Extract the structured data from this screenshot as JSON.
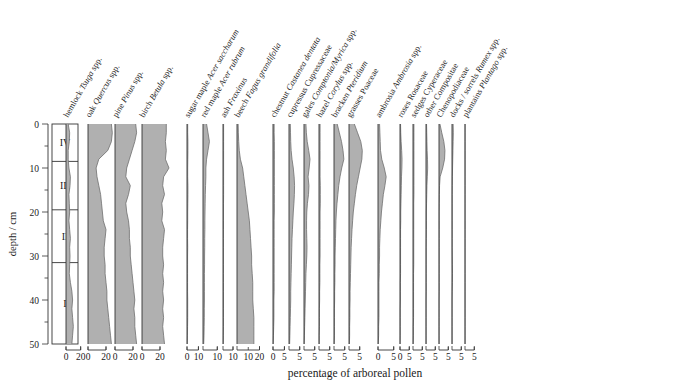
{
  "figure": {
    "kind": "pollen-stratigraphic-diagram",
    "caption": "percentage of arboreal pollen",
    "depth_axis_label": "depth / cm",
    "colors": {
      "fill": "#b0b0b0",
      "stroke": "#6e6e6e",
      "axis": "#333333",
      "text": "#1a1a1a",
      "background": "#ffffff"
    }
  },
  "depth_axis": {
    "label": "depth / cm",
    "min": 0,
    "max": 50,
    "major_ticks": [
      0,
      10,
      20,
      30,
      40,
      50
    ],
    "major_tick_labels": [
      "0",
      "10",
      "20",
      "30",
      "40",
      "50"
    ],
    "minor_tick_step": 5
  },
  "zones": [
    {
      "name": "IV",
      "top": 0,
      "bottom": 8.5
    },
    {
      "name": "III",
      "top": 8.5,
      "bottom": 19.5
    },
    {
      "name": "II",
      "top": 19.5,
      "bottom": 31.5
    },
    {
      "name": "I",
      "top": 31.5,
      "bottom": 50
    }
  ],
  "chart_data": {
    "type": "area",
    "title": "",
    "xlabel": "percentage of arboreal pollen",
    "ylabel": "depth / cm",
    "ylim": [
      0,
      50
    ],
    "grid": false,
    "legend": "none",
    "orientation": "vertical-depth-down",
    "depths": [
      0,
      2,
      4,
      6,
      8,
      10,
      12,
      14,
      16,
      18,
      20,
      22,
      24,
      26,
      28,
      30,
      32,
      34,
      36,
      38,
      40,
      42,
      44,
      46,
      48,
      50
    ],
    "taxa": [
      {
        "common": "hemlock",
        "latin": "Tsuga spp.",
        "latin_italic": "Tsuga",
        "latin_plain": " spp.",
        "xmax": 30,
        "ticks": [
          0,
          20
        ],
        "tick_labels": [
          "0",
          "20"
        ],
        "values": [
          3,
          5,
          4.5,
          3,
          3,
          4,
          6,
          5.5,
          4,
          4.5,
          5,
          4,
          5,
          6,
          5,
          5.5,
          5,
          4.5,
          6,
          8,
          9,
          8,
          9,
          10,
          9,
          8
        ]
      },
      {
        "common": "oak",
        "latin": "Quercus spp.",
        "latin_italic": "Quercus",
        "latin_plain": " spp.",
        "xmax": 30,
        "ticks": [
          0,
          20
        ],
        "tick_labels": [
          "0",
          "20"
        ],
        "values": [
          26,
          27,
          26,
          22,
          12,
          9,
          10,
          12,
          14,
          15,
          16,
          17,
          20,
          19,
          18,
          18,
          19,
          19,
          20,
          21,
          21,
          22,
          23,
          24,
          25,
          26
        ]
      },
      {
        "common": "pine",
        "latin": "Pinus spp.",
        "latin_italic": "Pinus",
        "latin_plain": " spp.",
        "xmax": 30,
        "ticks": [
          0,
          20
        ],
        "tick_labels": [
          "0",
          "20"
        ],
        "values": [
          23,
          24,
          22,
          19,
          16,
          13,
          12,
          17,
          15,
          12,
          13,
          15,
          16,
          16,
          17,
          17,
          18,
          19,
          20,
          21,
          22,
          21,
          22,
          22,
          23,
          24
        ]
      },
      {
        "common": "birch",
        "latin": "Betula spp.",
        "latin_italic": "Betula",
        "latin_plain": " spp.",
        "xmax": 30,
        "ticks": [
          0,
          20
        ],
        "tick_labels": [
          "0",
          "20"
        ],
        "values": [
          27,
          27,
          26,
          27,
          26,
          30,
          24,
          23,
          25,
          22,
          23,
          22,
          25,
          24,
          23,
          23,
          24,
          23,
          24,
          23,
          24,
          23,
          24,
          23,
          24,
          25
        ]
      },
      {
        "common": "sugar maple",
        "latin": "Acer saccharum",
        "latin_italic": "Acer saccharum",
        "latin_plain": "",
        "xmax": 14,
        "ticks": [
          0,
          10
        ],
        "tick_labels": [
          "0",
          "10"
        ],
        "values": [
          0.6,
          0.6,
          0.8,
          0.8,
          0.7,
          0.6,
          0.6,
          0.8,
          0.8,
          0.7,
          0.6,
          0.6,
          0.5,
          0.5,
          0.6,
          0.5,
          0.5,
          0.5,
          0.5,
          0.5,
          0.6,
          0.6,
          0.6,
          0.5,
          0.4,
          0.3
        ]
      },
      {
        "common": "red maple",
        "latin": "Acer rubrum",
        "latin_italic": "Acer rubrum",
        "latin_plain": "",
        "xmax": 14,
        "ticks": [
          10
        ],
        "tick_labels": [
          "10"
        ],
        "values": [
          2.5,
          3.5,
          4.5,
          3.5,
          2.5,
          2,
          2,
          1.8,
          1.6,
          1.5,
          1.4,
          1.3,
          1.3,
          1.2,
          1.2,
          1.1,
          1.1,
          1,
          1,
          1,
          1,
          0.9,
          0.9,
          0.8,
          0.7,
          0.5
        ]
      },
      {
        "common": "ash",
        "latin": "Fraxinus",
        "latin_italic": "Fraxinus",
        "latin_plain": "",
        "xmax": 14,
        "ticks": [
          10
        ],
        "tick_labels": [
          "10"
        ],
        "values": [
          0.6,
          0.6,
          0.6,
          0.6,
          0.6,
          0.6,
          0.6,
          0.6,
          0.6,
          0.5,
          0.5,
          0.5,
          0.5,
          0.5,
          0.5,
          0.5,
          0.5,
          0.5,
          0.5,
          0.5,
          0.5,
          0.5,
          0.5,
          0.5,
          0.4,
          0.3
        ]
      },
      {
        "common": "beech",
        "latin": "Fagus grandifolia",
        "latin_italic": "Fagus grandifolia",
        "latin_plain": "",
        "xmax": 24,
        "ticks": [
          10,
          20
        ],
        "tick_labels": [
          "10",
          "20"
        ],
        "values": [
          1,
          1.2,
          1.5,
          2,
          3,
          5,
          6,
          7,
          8,
          9,
          10,
          11,
          11.5,
          12,
          12.5,
          13,
          13,
          13.5,
          14,
          14,
          14,
          14.5,
          15,
          15,
          15,
          15
        ]
      },
      {
        "common": "chestnut",
        "latin": "Castanea dentata",
        "latin_italic": "Castanea dentata",
        "latin_plain": "",
        "xmax": 7,
        "ticks": [
          0,
          5
        ],
        "tick_labels": [
          "0",
          "5"
        ],
        "values": [
          0.5,
          0.5,
          0.6,
          0.6,
          0.6,
          0.6,
          0.6,
          0.6,
          0.6,
          0.6,
          0.6,
          0.5,
          0.5,
          0.5,
          0.5,
          0.5,
          0.5,
          0.5,
          0.5,
          0.5,
          0.4,
          0.4,
          0.4,
          0.3,
          0.2,
          0.1
        ]
      },
      {
        "common": "cupressus",
        "latin": "Cupressaceae",
        "latin_italic": "",
        "latin_plain": "Cupressaceae",
        "xmax": 7,
        "ticks": [
          5
        ],
        "tick_labels": [
          "5"
        ],
        "values": [
          0.6,
          0.7,
          0.8,
          1,
          1.4,
          2,
          2.4,
          2.6,
          2.5,
          2.3,
          2,
          1.8,
          1.6,
          1.4,
          1.3,
          1.2,
          1.1,
          1,
          0.9,
          0.8,
          0.8,
          0.7,
          0.6,
          0.5,
          0.4,
          0.3
        ]
      },
      {
        "common": "gales",
        "latin": "Comptonia/Myrica spp.",
        "latin_italic": "Comptonia/Myrica",
        "latin_plain": " spp.",
        "xmax": 7,
        "ticks": [
          5
        ],
        "tick_labels": [
          "5"
        ],
        "values": [
          0.9,
          1.1,
          1.5,
          2.2,
          2.8,
          2.4,
          1.9,
          2.3,
          2.1,
          1.6,
          1.3,
          1.2,
          1.2,
          1.3,
          1.4,
          1.3,
          1.1,
          0.9,
          0.8,
          0.7,
          0.6,
          0.5,
          0.4,
          0.3,
          0.2,
          0.1
        ]
      },
      {
        "common": "hazel",
        "latin": "Corylus spp.",
        "latin_italic": "Corylus",
        "latin_plain": " spp.",
        "xmax": 7,
        "ticks": [
          5
        ],
        "tick_labels": [
          "5"
        ],
        "values": [
          0.5,
          0.5,
          0.5,
          0.5,
          0.5,
          0.5,
          0.5,
          0.6,
          0.6,
          0.6,
          0.5,
          0.5,
          0.5,
          0.5,
          0.5,
          0.5,
          0.4,
          0.4,
          0.4,
          0.3,
          0.3,
          0.2,
          0.2,
          0.2,
          0.1,
          0.1
        ]
      },
      {
        "common": "bracken",
        "latin": "Pteridium",
        "latin_italic": "Pteridium",
        "latin_plain": "",
        "xmax": 7,
        "ticks": [
          5
        ],
        "tick_labels": [
          "5"
        ],
        "values": [
          1.5,
          2.5,
          3.5,
          4.2,
          4.6,
          3.6,
          2.8,
          2.2,
          1.8,
          1.4,
          1.1,
          0.9,
          0.8,
          0.7,
          0.6,
          0.5,
          0.5,
          0.4,
          0.4,
          0.3,
          0.3,
          0.2,
          0.2,
          0.2,
          0.2,
          0.1
        ]
      },
      {
        "common": "grasses",
        "latin": "Poaceae",
        "latin_italic": "",
        "latin_plain": "Poaceae",
        "xmax": 7,
        "ticks": [
          5
        ],
        "tick_labels": [
          "5"
        ],
        "values": [
          2.5,
          4,
          5.5,
          6.2,
          6,
          5.2,
          4.4,
          3.6,
          3,
          2.5,
          2,
          1.7,
          1.4,
          1.2,
          1,
          0.9,
          0.8,
          0.7,
          0.6,
          0.5,
          0.5,
          0.4,
          0.4,
          0.3,
          0.3,
          0.2
        ]
      },
      {
        "common": "ambrosia",
        "latin": "Ambrosia spp.",
        "latin_italic": "Ambrosia",
        "latin_plain": " spp.",
        "xmax": 7,
        "ticks": [
          0,
          5
        ],
        "tick_labels": [
          "0",
          "5"
        ],
        "values": [
          0.5,
          0.6,
          0.7,
          0.8,
          1.2,
          2.0,
          2.6,
          2.2,
          1.7,
          1.4,
          1.1,
          0.9,
          0.7,
          0.6,
          0.5,
          0.5,
          0.4,
          0.4,
          0.3,
          0.3,
          0.3,
          0.3,
          0.3,
          0.2,
          0.2,
          0.1
        ]
      },
      {
        "common": "roses",
        "latin": "Rosaceae",
        "latin_italic": "",
        "latin_plain": "Rosaceae",
        "xmax": 7,
        "ticks": [
          0,
          5
        ],
        "tick_labels": [
          "0",
          "5"
        ],
        "values": [
          0.3,
          0.4,
          0.6,
          0.9,
          1.1,
          1.0,
          0.8,
          0.7,
          0.6,
          0.5,
          0.4,
          0.4,
          0.3,
          0.3,
          0.3,
          0.3,
          0.3,
          0.3,
          0.2,
          0.2,
          0.2,
          0.1,
          0.1,
          0.1,
          0.1,
          0.05
        ]
      },
      {
        "common": "sedges",
        "latin": "Cyperaceae",
        "latin_italic": "",
        "latin_plain": "Cyperaceae",
        "xmax": 7,
        "ticks": [
          5
        ],
        "tick_labels": [
          "5"
        ],
        "values": [
          0.5,
          0.5,
          0.5,
          0.5,
          0.5,
          0.5,
          0.5,
          0.5,
          0.5,
          0.4,
          0.4,
          0.4,
          0.4,
          0.4,
          0.4,
          0.4,
          0.4,
          0.3,
          0.3,
          0.3,
          0.3,
          0.3,
          0.3,
          0.2,
          0.2,
          0.1
        ]
      },
      {
        "common": "other",
        "latin": "Compositae",
        "latin_italic": "",
        "latin_plain": "Compositae",
        "xmax": 7,
        "ticks": [
          5
        ],
        "tick_labels": [
          "5"
        ],
        "values": [
          0.3,
          0.4,
          0.5,
          0.6,
          0.8,
          0.9,
          0.7,
          0.5,
          0.4,
          0.3,
          0.2,
          0.2,
          0.2,
          0.15,
          0.1,
          0.1,
          0.1,
          0.1,
          0.1,
          0.1,
          0.05,
          0.05,
          0.05,
          0.05,
          0.05,
          0.05
        ]
      },
      {
        "common": "",
        "latin": "Chenopodiaceae",
        "latin_italic": "",
        "latin_plain": "Chenopodiaceae",
        "xmax": 7,
        "ticks": [
          5
        ],
        "tick_labels": [
          "5"
        ],
        "values": [
          0.5,
          1.5,
          2.6,
          3.2,
          3.0,
          2.0,
          0.6,
          0.3,
          0.2,
          0.15,
          0.1,
          0.1,
          0.1,
          0.1,
          0.1,
          0.1,
          0.1,
          0.1,
          0.1,
          0.1,
          0.05,
          0.05,
          0.05,
          0.05,
          0.05,
          0.05
        ]
      },
      {
        "common": "docks / sorrels",
        "latin": "Rumex spp.",
        "latin_italic": "Rumex",
        "latin_plain": " spp.",
        "xmax": 7,
        "ticks": [
          5
        ],
        "tick_labels": [
          "5"
        ],
        "values": [
          0.6,
          0.7,
          0.6,
          0.5,
          0.4,
          0.3,
          0.2,
          0.15,
          0.1,
          0.1,
          0.1,
          0.1,
          0.1,
          0.1,
          0.1,
          0.15,
          0.2,
          0.25,
          0.2,
          0.1,
          0.05,
          0.05,
          0.05,
          0.05,
          0.05,
          0.05
        ]
      },
      {
        "common": "plantains",
        "latin": "Plantago spp.",
        "latin_italic": "Plantago",
        "latin_plain": " spp.",
        "xmax": 7,
        "ticks": [
          5
        ],
        "tick_labels": [
          "5"
        ],
        "values": [
          0.05,
          0.05,
          0.05,
          0.05,
          0.05,
          0.05,
          0.05,
          0.05,
          0.05,
          0.05,
          0.05,
          0.05,
          0.05,
          0.05,
          0.05,
          0.05,
          0.05,
          0.05,
          0.05,
          0.05,
          0.05,
          0.05,
          0.05,
          0.05,
          0.05,
          0.05
        ]
      }
    ]
  }
}
